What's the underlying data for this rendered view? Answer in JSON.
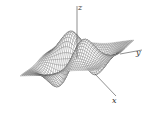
{
  "chart_data": {
    "type": "surface3d",
    "title": "",
    "function": "z = x*y*exp(-(x^2+y^2)/2) style surface with two peaks and two troughs",
    "xlabel": "x",
    "ylabel": "y",
    "zlabel": "z",
    "x_range": [
      -3,
      3
    ],
    "y_range": [
      -3,
      3
    ],
    "grid_resolution": 40,
    "features": {
      "peaks": 2,
      "troughs": 2,
      "style": "wireframe mesh, gray lines on white"
    },
    "grid": false,
    "legend": null
  },
  "colors": {
    "mesh": "#555555",
    "face": "#ffffff",
    "axis": "#444444",
    "background": "#ffffff"
  }
}
